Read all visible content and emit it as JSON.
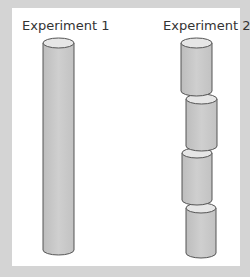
{
  "experiments": [
    {
      "label": "Experiment 1",
      "description": "single long cylinder",
      "segments": 1
    },
    {
      "label": "Experiment 2",
      "description": "cylinder cut into four offset segments",
      "segments": 4
    }
  ],
  "colors": {
    "background_frame": "#d4d4d4",
    "panel": "#ffffff",
    "cylinder_body": "#c9c9c9",
    "cylinder_top": "#e6e6e6",
    "outline": "#555555"
  }
}
